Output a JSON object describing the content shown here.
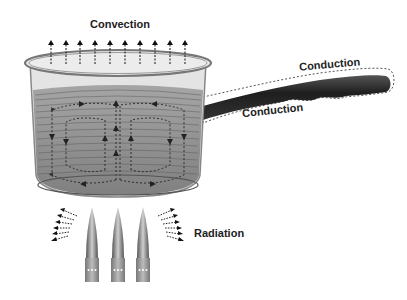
{
  "diagram": {
    "labels": {
      "convection": "Convection",
      "conduction_top": "Conduction",
      "conduction_bottom": "Conduction",
      "radiation": "Radiation"
    },
    "elements": {
      "pot": "saucepan with water",
      "handle": "pan handle",
      "burners": 3,
      "convection_arrows": 10,
      "radiation_arrows_per_side": 6
    },
    "colors": {
      "pot_glass": "#d8d8d8",
      "water": "#8a8a8a",
      "handle": "#2a2a2a",
      "flame": "#777777",
      "text": "#222222"
    }
  }
}
